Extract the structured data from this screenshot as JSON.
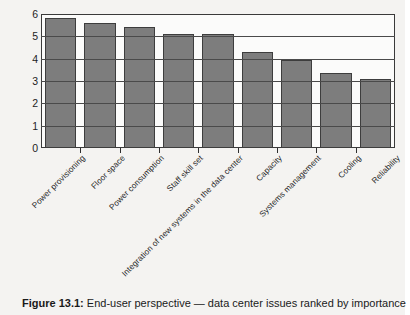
{
  "caption": {
    "label": "Figure 13.1:",
    "text": " End-user perspective — data center issues ranked by importance"
  },
  "chart_data": {
    "type": "bar",
    "title": "",
    "xlabel": "",
    "ylabel": "",
    "ylim": [
      0,
      6
    ],
    "yticks": [
      "0",
      "1",
      "2",
      "3",
      "4",
      "5",
      "6"
    ],
    "grid": true,
    "legend": "none",
    "orientation": "vertical",
    "bar_color": "#7d7d7d",
    "categories": [
      "Power provisioning",
      "Floor space",
      "Power consumption",
      "Staff skill set",
      "Integration of new systems in the data center",
      "Capacity",
      "Systems management",
      "Cooling",
      "Reliability"
    ],
    "values": [
      5.8,
      5.6,
      5.4,
      5.1,
      5.1,
      4.3,
      3.95,
      3.35,
      3.1
    ]
  }
}
